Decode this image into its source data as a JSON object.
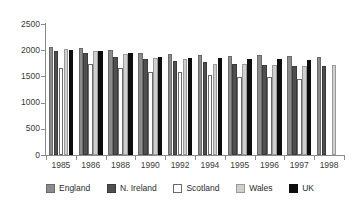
{
  "chart_data": {
    "type": "bar",
    "title": "",
    "subtitle": "",
    "xlabel": "",
    "ylabel": "",
    "ylim": [
      0,
      2500
    ],
    "yticks": [
      0,
      500,
      1000,
      1500,
      2000,
      2500
    ],
    "ytick_labels": [
      "0",
      "500",
      "1000",
      "1500",
      "2000",
      "2500"
    ],
    "grid": false,
    "legend_position": "bottom",
    "categories": [
      "1985",
      "1986",
      "1988",
      "1990",
      "1992",
      "1994",
      "1995",
      "1996",
      "1997",
      "1998"
    ],
    "series": [
      {
        "name": "England",
        "color": "#8c8c8c",
        "values": [
          2060,
          2040,
          2000,
          1950,
          1925,
          1900,
          1890,
          1900,
          1885,
          1870
        ]
      },
      {
        "name": "N. Ireland",
        "color": "#4f4f4f",
        "values": [
          1985,
          1950,
          1870,
          1840,
          1800,
          1780,
          1745,
          1725,
          1695,
          1690
        ]
      },
      {
        "name": "Scotland",
        "color": "#ffffff",
        "values": [
          1660,
          1735,
          1670,
          1585,
          1585,
          1520,
          1495,
          1485,
          1460,
          null
        ]
      },
      {
        "name": "Wales",
        "color": "#cfcfcf",
        "values": [
          2015,
          1985,
          1920,
          1855,
          1825,
          1745,
          1730,
          1715,
          1705,
          1710
        ]
      },
      {
        "name": "UK",
        "color": "#0d0d0d",
        "values": [
          2010,
          1985,
          1940,
          1870,
          1845,
          1850,
          1840,
          1825,
          1805,
          null
        ]
      }
    ]
  },
  "legend": {
    "items": [
      {
        "label": "England",
        "swatch": "#8c8c8c",
        "border": "#6a6a6a"
      },
      {
        "label": "N. Ireland",
        "swatch": "#4f4f4f",
        "border": "#3a3a3a"
      },
      {
        "label": "Scotland",
        "swatch": "#ffffff",
        "border": "#6a6a6a"
      },
      {
        "label": "Wales",
        "swatch": "#cfcfcf",
        "border": "#9a9a9a"
      },
      {
        "label": "UK",
        "swatch": "#0d0d0d",
        "border": "#0d0d0d"
      }
    ]
  }
}
